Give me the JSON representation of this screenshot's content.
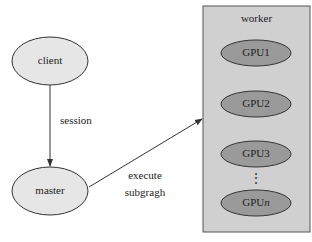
{
  "nodes": {
    "client": {
      "label": "client"
    },
    "master": {
      "label": "master"
    }
  },
  "edges": {
    "session": {
      "label": "session"
    },
    "execute": {
      "line1": "execute",
      "line2": "subgragh"
    }
  },
  "worker": {
    "title": "worker",
    "gpus": [
      "GPU1",
      "GPU2",
      "GPU3"
    ],
    "ellipsis": "⋮",
    "last_gpu_prefix": "GPU",
    "last_gpu_suffix": "n"
  },
  "colors": {
    "node_fill": "#e6e6e6",
    "worker_fill": "#d0d0d0",
    "gpu_fill": "#9a9a9a",
    "stroke": "#333333"
  }
}
